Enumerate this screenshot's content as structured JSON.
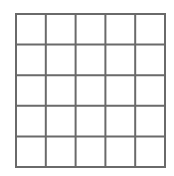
{
  "grid": {
    "rows": 5,
    "cols": 5,
    "line_color": "#6a6a6a",
    "background": "#ffffff",
    "line_width": 2
  }
}
